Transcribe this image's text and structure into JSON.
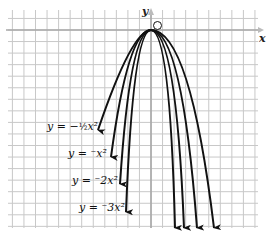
{
  "chart_data": {
    "type": "line",
    "title": "",
    "xlabel": "x",
    "ylabel": "y",
    "origin_label": "O",
    "grid": true,
    "vertex": [
      0,
      0
    ],
    "series": [
      {
        "name": "y = -1/2 x^2",
        "label_display": "y = −½x²",
        "coefficient": -0.5
      },
      {
        "name": "y = -x^2",
        "label_display": "y = ⁻x²",
        "coefficient": -1
      },
      {
        "name": "y = -2x^2",
        "label_display": "y = ⁻2x²",
        "coefficient": -2
      },
      {
        "name": "y = -3x^2",
        "label_display": "y = ⁻3x²",
        "coefficient": -3
      }
    ]
  },
  "labels": {
    "y_axis": "y",
    "x_axis": "x",
    "origin": "O",
    "curve1": "y = −",
    "curve1_frac": "½",
    "curve1_tail": "x²",
    "curve2": "y = ⁻x²",
    "curve3": "y = ⁻2x²",
    "curve4": "y = ⁻3x²"
  },
  "colors": {
    "grid": "#c8c8c8",
    "axis": "#a8a8a8",
    "curve": "#111111"
  }
}
